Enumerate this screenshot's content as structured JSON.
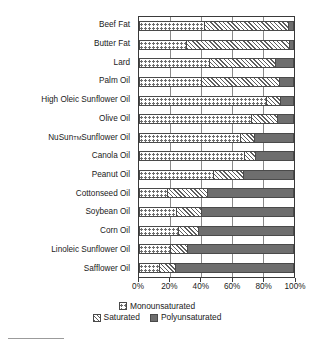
{
  "chart_data": {
    "type": "bar",
    "orientation": "horizontal",
    "stacked": true,
    "stack_mode": "percent",
    "title": "",
    "subtitle": "",
    "xlabel": "",
    "ylabel": "",
    "xlim": [
      0,
      100
    ],
    "xticks": [
      0,
      20,
      40,
      60,
      80,
      100
    ],
    "xtick_labels": [
      "0%",
      "20%",
      "40%",
      "60%",
      "80%",
      "100%"
    ],
    "grid": true,
    "grid_axis": "x",
    "legend_position": "bottom",
    "categories": [
      "Beef Fat",
      "Butter Fat",
      "Lard",
      "Palm Oil",
      "High Oleic Sunflower Oil",
      "NuSun™ Sunflower Oil",
      "Olive Oil",
      "Canola Oil",
      "Peanut Oil",
      "Cottonseed Oil",
      "Soybean Oil",
      "Corn Oil",
      "Linoleic Sunflower Oil",
      "Safflower Oil"
    ],
    "series": [
      {
        "name": "Monounsaturated",
        "values": [
          42,
          30,
          45,
          40,
          82,
          72,
          65,
          68,
          48,
          18,
          24,
          25,
          20,
          13
        ]
      },
      {
        "name": "Saturated",
        "values": [
          54,
          67,
          43,
          50,
          9,
          17,
          9,
          7,
          19,
          26,
          16,
          13,
          11,
          10
        ]
      },
      {
        "name": "Polyunsaturated",
        "values": [
          4,
          3,
          12,
          10,
          9,
          11,
          26,
          25,
          33,
          56,
          60,
          62,
          69,
          77
        ]
      }
    ]
  },
  "y_categories": [
    {
      "label": "Beef Fat",
      "sup": ""
    },
    {
      "label": "Butter Fat",
      "sup": ""
    },
    {
      "label": "Lard",
      "sup": ""
    },
    {
      "label": "Palm Oil",
      "sup": ""
    },
    {
      "label": "High Oleic Sunflower Oil",
      "sup": ""
    },
    {
      "label": "Olive Oil",
      "sup": ""
    },
    {
      "label": "NuSun",
      "sup": "TM",
      "label_tail": " Sunflower Oil"
    },
    {
      "label": "Canola Oil",
      "sup": ""
    },
    {
      "label": "Peanut Oil",
      "sup": ""
    },
    {
      "label": "Cottonseed Oil",
      "sup": ""
    },
    {
      "label": "Soybean Oil",
      "sup": ""
    },
    {
      "label": "Corn Oil",
      "sup": ""
    },
    {
      "label": "Linoleic Sunflower Oil",
      "sup": ""
    },
    {
      "label": "Safflower Oil",
      "sup": ""
    }
  ],
  "bars": [
    {
      "category": "Beef Fat",
      "mono": 42,
      "sat": 54,
      "poly": 4
    },
    {
      "category": "Butter Fat",
      "mono": 30,
      "sat": 67,
      "poly": 3
    },
    {
      "category": "Lard",
      "mono": 45,
      "sat": 43,
      "poly": 12
    },
    {
      "category": "Palm Oil",
      "mono": 40,
      "sat": 50,
      "poly": 10
    },
    {
      "category": "High Oleic Sunflower Oil",
      "mono": 82,
      "sat": 9,
      "poly": 9
    },
    {
      "category": "Olive Oil",
      "mono": 72,
      "sat": 17,
      "poly": 11
    },
    {
      "category": "NuSun Sunflower Oil",
      "mono": 65,
      "sat": 9,
      "poly": 26
    },
    {
      "category": "Canola Oil",
      "mono": 68,
      "sat": 7,
      "poly": 25
    },
    {
      "category": "Peanut Oil",
      "mono": 48,
      "sat": 19,
      "poly": 33
    },
    {
      "category": "Cottonseed Oil",
      "mono": 18,
      "sat": 26,
      "poly": 56
    },
    {
      "category": "Soybean Oil",
      "mono": 24,
      "sat": 16,
      "poly": 60
    },
    {
      "category": "Corn Oil",
      "mono": 25,
      "sat": 13,
      "poly": 62
    },
    {
      "category": "Linoleic Sunflower Oil",
      "mono": 20,
      "sat": 11,
      "poly": 69
    },
    {
      "category": "Safflower Oil",
      "mono": 13,
      "sat": 10,
      "poly": 77
    }
  ],
  "axis": {
    "ticks": [
      {
        "value": 0,
        "label": "0%"
      },
      {
        "value": 20,
        "label": "20%"
      },
      {
        "value": 40,
        "label": "40%"
      },
      {
        "value": 60,
        "label": "60%"
      },
      {
        "value": 80,
        "label": "80%"
      },
      {
        "value": 100,
        "label": "100%"
      }
    ]
  },
  "legend": {
    "row1": [
      {
        "key": "mono",
        "label": "Monounsaturated"
      }
    ],
    "row2": [
      {
        "key": "sat",
        "label": "Saturated"
      },
      {
        "key": "poly",
        "label": "Polyunsaturated"
      }
    ]
  },
  "colors": {
    "monounsaturated": "#ffffff",
    "monounsaturated_dot": "#6d6d6d",
    "saturated": "#e8e8e8",
    "saturated_hatch": "#5f5f5f",
    "polyunsaturated": "#6e6e6e",
    "axis": "#3a3a3a",
    "grid": "#8a8a8a",
    "text": "#1a1a1a",
    "background": "#ffffff"
  }
}
